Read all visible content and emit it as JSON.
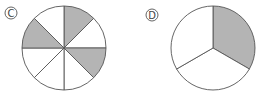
{
  "figures": [
    {
      "label": "C",
      "center": [
        64,
        48
      ],
      "radius": 42,
      "slices": 8,
      "shaded_slices": [
        0,
        2,
        6
      ],
      "shaded_count": 3,
      "total_slices": 8
    },
    {
      "label": "D",
      "center": [
        213,
        48
      ],
      "radius": 42,
      "slices": 3,
      "shaded_slices": [
        0
      ],
      "shaded_count": 1,
      "total_slices": 3
    }
  ],
  "colors": {
    "shade": "#b4b4b4",
    "stroke": "#555555",
    "fill": "#ffffff"
  }
}
